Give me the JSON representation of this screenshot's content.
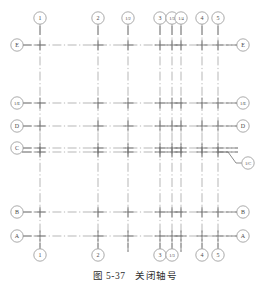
{
  "figure": {
    "caption_prefix": "图",
    "caption_number": "5-37",
    "caption_title": "关闭轴号",
    "type": "architectural-grid-axis-drawing"
  },
  "colors": {
    "grid_line": "#9a9a9a",
    "axis_solid": "#6f6f6f",
    "bubble_stroke": "#8d8d8d",
    "text": "#4a4a4a",
    "background": "#ffffff"
  },
  "style": {
    "bubble_radius": 6.2,
    "dash_pattern": "long-dash-dot"
  },
  "vertical_axes": [
    {
      "id": "v1",
      "label": "1",
      "x": 40,
      "top_label": true,
      "bottom_label": true,
      "y_top": 26,
      "y_bottom": 252
    },
    {
      "id": "v2",
      "label": "2",
      "x": 98,
      "top_label": true,
      "bottom_label": true,
      "y_top": 26,
      "y_bottom": 252
    },
    {
      "id": "v1_2",
      "label": "1/2",
      "x": 128,
      "top_label": true,
      "bottom_label": false,
      "y_top": 26,
      "y_bottom": 252
    },
    {
      "id": "v3",
      "label": "3",
      "x": 160,
      "top_label": true,
      "bottom_label": true,
      "y_top": 26,
      "y_bottom": 252
    },
    {
      "id": "v1_3",
      "label": "1/3",
      "x": 172,
      "top_label": true,
      "bottom_label": true,
      "y_top": 26,
      "y_bottom": 252
    },
    {
      "id": "v1_4",
      "label": "1/4",
      "x": 181,
      "top_label": true,
      "bottom_label": false,
      "y_top": 26,
      "y_bottom": 252
    },
    {
      "id": "v4",
      "label": "4",
      "x": 202,
      "top_label": true,
      "bottom_label": true,
      "y_top": 26,
      "y_bottom": 252
    },
    {
      "id": "v5",
      "label": "5",
      "x": 218,
      "top_label": true,
      "bottom_label": true,
      "y_top": 26,
      "y_bottom": 252
    }
  ],
  "horizontal_axes": [
    {
      "id": "hE",
      "label": "E",
      "y": 45,
      "left_label": true,
      "right_label": true,
      "x_left": 22,
      "x_right": 238
    },
    {
      "id": "h1_E",
      "label": "1/E",
      "y": 103,
      "left_label": true,
      "right_label": true,
      "x_left": 22,
      "x_right": 238
    },
    {
      "id": "hD",
      "label": "D",
      "y": 126,
      "left_label": true,
      "right_label": true,
      "x_left": 22,
      "x_right": 238
    },
    {
      "id": "hC",
      "label": "C",
      "y": 148,
      "left_label": true,
      "right_label": false,
      "x_left": 22,
      "x_right": 238
    },
    {
      "id": "h1_C",
      "label": "1/C",
      "y": 152,
      "left_label": false,
      "right_label": true,
      "x_left": 22,
      "x_right": 238,
      "leader": true
    },
    {
      "id": "hB",
      "label": "B",
      "y": 212,
      "left_label": true,
      "right_label": true,
      "x_left": 22,
      "x_right": 238
    },
    {
      "id": "hA",
      "label": "A",
      "y": 236,
      "left_label": true,
      "right_label": true,
      "x_left": 22,
      "x_right": 238
    }
  ],
  "bubbles": {
    "top_row_y": 18,
    "bottom_row_y": 255,
    "left_col_x": 17,
    "right_col_x": 243,
    "leader_label_x": 248,
    "leader_label_y": 163
  }
}
